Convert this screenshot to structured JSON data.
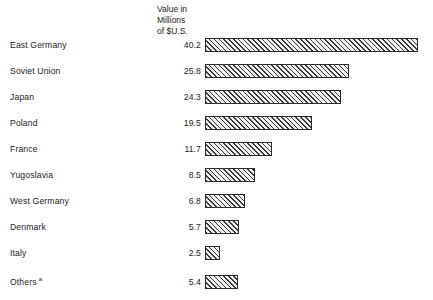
{
  "header": {
    "line1": "Value in",
    "line2": "Millions",
    "line3": "of $U.S."
  },
  "footnote_marker": "a",
  "chart_data": {
    "type": "bar",
    "orientation": "horizontal",
    "title": "",
    "subtitle": "",
    "xlabel": "",
    "ylabel": "",
    "value_header": "Value in Millions of $U.S.",
    "units": "Millions of $U.S.",
    "grid": false,
    "legend": null,
    "xlim": [
      0,
      40.2
    ],
    "categories": [
      "East Germany",
      "Soviet Union",
      "Japan",
      "Poland",
      "France",
      "Yugoslavia",
      "West Germany",
      "Denmark",
      "Italy",
      "Others"
    ],
    "values": [
      40.2,
      25.8,
      24.3,
      19.5,
      11.7,
      8.5,
      6.8,
      5.7,
      2.5,
      5.4
    ],
    "value_labels": [
      "40.2",
      "25.8",
      "24.3",
      "19.5",
      "11.7",
      "8.5",
      "6.8",
      "5.7",
      "2.5",
      "5.4"
    ],
    "annotations": [
      {
        "category": "Others",
        "marker": "a"
      }
    ]
  },
  "rows": [
    {
      "label": "East Germany",
      "value": "40.2",
      "width_px": 213,
      "top_px": 35
    },
    {
      "label": "Soviet Union",
      "value": "25.8",
      "width_px": 144,
      "top_px": 61
    },
    {
      "label": "Japan",
      "value": "24.3",
      "width_px": 136,
      "top_px": 87
    },
    {
      "label": "Poland",
      "value": "19.5",
      "width_px": 107,
      "top_px": 113
    },
    {
      "label": "France",
      "value": "11.7",
      "width_px": 67,
      "top_px": 139
    },
    {
      "label": "Yugoslavia",
      "value": "8.5",
      "width_px": 50,
      "top_px": 165
    },
    {
      "label": "West Germany",
      "value": "6.8",
      "width_px": 40,
      "top_px": 191
    },
    {
      "label": "Denmark",
      "value": "5.7",
      "width_px": 34,
      "top_px": 217
    },
    {
      "label": "Italy",
      "value": "2.5",
      "width_px": 15,
      "top_px": 243
    },
    {
      "label": "Others",
      "value": "5.4",
      "width_px": 33,
      "top_px": 272,
      "marker": "a"
    }
  ]
}
